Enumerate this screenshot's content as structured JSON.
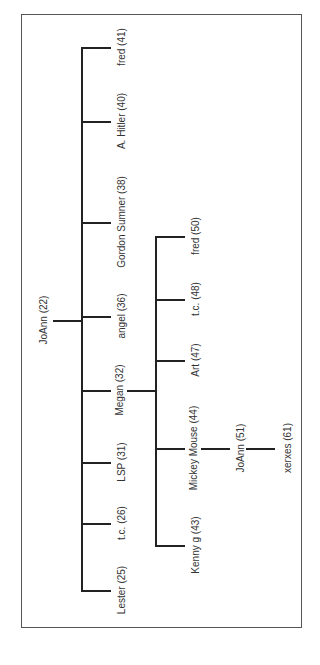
{
  "diagram": {
    "type": "family-tree",
    "orientation": "rotated-90",
    "root": {
      "label": "JoAnn (22)"
    },
    "level1": [
      {
        "label": "fred (41)"
      },
      {
        "label": "A. Hitler (40)"
      },
      {
        "label": "Gordon Sumner (38)"
      },
      {
        "label": "angel (36)"
      },
      {
        "label": "Megan (32)"
      },
      {
        "label": "LSP (31)"
      },
      {
        "label": "t.c. (26)"
      },
      {
        "label": "Lester (25)"
      }
    ],
    "megan_children": [
      {
        "label": "fred (50)"
      },
      {
        "label": "t.c. (48)"
      },
      {
        "label": "Art (47)"
      },
      {
        "label": "Mickey Mouse (44)"
      },
      {
        "label": "Kenny g (43)"
      }
    ],
    "mickey_child": {
      "label": "JoAnn (51)"
    },
    "joann51_child": {
      "label": "xerxes (61)"
    }
  }
}
